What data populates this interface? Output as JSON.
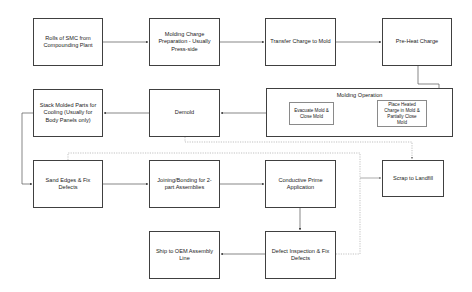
{
  "diagram": {
    "type": "process-flowchart",
    "nodes": {
      "rolls_smc": "Rolls of SMC from Compounding Plant",
      "charge_prep": "Molding Charge Preparation - Usually Press-side",
      "transfer_charge": "Transfer Charge to Mold",
      "preheat": "Pre-Heat Charge",
      "molding_operation": "Molding Operation",
      "place_heated": "Place Heated Charge in Mold & Partially Close Mold",
      "evacuate": "Evacuate Mold & Close Mold",
      "demold": "Demold",
      "stack_cooling": "Stack Molded Parts for Cooling (Usually for Body Panels only)",
      "sand_edges": "Sand Edges & Fix Defects",
      "joining": "Joining/Bonding for 2-part Assemblies",
      "conductive_prime": "Conductive Prime Application",
      "scrap": "Scrap to Landfill",
      "defect_inspection": "Defect Inspection & Fix Defects",
      "ship_oem": "Ship to OEM Assembly Line"
    },
    "edges": [
      {
        "from": "rolls_smc",
        "to": "charge_prep",
        "style": "solid"
      },
      {
        "from": "charge_prep",
        "to": "transfer_charge",
        "style": "solid"
      },
      {
        "from": "transfer_charge",
        "to": "preheat",
        "style": "solid"
      },
      {
        "from": "preheat",
        "to": "place_heated",
        "style": "solid"
      },
      {
        "from": "evacuate",
        "to": "demold",
        "style": "solid"
      },
      {
        "from": "demold",
        "to": "stack_cooling",
        "style": "solid"
      },
      {
        "from": "stack_cooling",
        "to": "sand_edges",
        "style": "solid"
      },
      {
        "from": "sand_edges",
        "to": "joining",
        "style": "solid"
      },
      {
        "from": "joining",
        "to": "conductive_prime",
        "style": "solid"
      },
      {
        "from": "conductive_prime",
        "to": "defect_inspection",
        "style": "solid"
      },
      {
        "from": "defect_inspection",
        "to": "ship_oem",
        "style": "solid"
      },
      {
        "from": "demold",
        "to": "scrap",
        "style": "dashed"
      },
      {
        "from": "sand_edges",
        "to": "scrap",
        "style": "dashed"
      },
      {
        "from": "defect_inspection",
        "to": "scrap",
        "style": "dashed"
      }
    ],
    "colors": {
      "box_border": "#404040",
      "inner_box_border": "#8a8a8a",
      "solid_line": "#555555",
      "dashed_line": "#a0a0a0",
      "text": "#222222"
    }
  }
}
